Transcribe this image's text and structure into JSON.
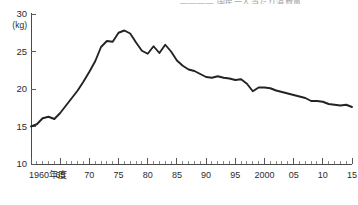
{
  "title_partial": "———— 国民一人当たり消費量",
  "chart_data": {
    "type": "line",
    "title": "",
    "xlabel": "",
    "ylabel": "",
    "unit_label": "(kg)",
    "ylim": [
      10,
      30
    ],
    "xlim": [
      1960,
      2015
    ],
    "grid": false,
    "legend": "none",
    "y_ticks": [
      "30",
      "25",
      "20",
      "15",
      "10"
    ],
    "y_tick_values": [
      30,
      25,
      20,
      15,
      10
    ],
    "x_ticks": [
      "1960年度",
      "65",
      "70",
      "75",
      "80",
      "85",
      "90",
      "95",
      "2000",
      "05",
      "10",
      "15"
    ],
    "x_tick_values": [
      1960,
      1965,
      1970,
      1975,
      1980,
      1985,
      1990,
      1995,
      2000,
      2005,
      2010,
      2015
    ],
    "series": [
      {
        "name": "一人当たり消費量",
        "color": "#232323",
        "x": [
          1960,
          1961,
          1962,
          1963,
          1964,
          1965,
          1966,
          1967,
          1968,
          1969,
          1970,
          1971,
          1972,
          1973,
          1974,
          1975,
          1976,
          1977,
          1978,
          1979,
          1980,
          1981,
          1982,
          1983,
          1984,
          1985,
          1986,
          1987,
          1988,
          1989,
          1990,
          1991,
          1992,
          1993,
          1994,
          1995,
          1996,
          1997,
          1998,
          1999,
          2000,
          2001,
          2002,
          2003,
          2004,
          2005,
          2006,
          2007,
          2008,
          2009,
          2010,
          2011,
          2012,
          2013,
          2014,
          2015
        ],
        "values": [
          15.0,
          15.3,
          16.1,
          16.3,
          16.0,
          16.8,
          17.8,
          18.8,
          19.8,
          21.0,
          22.3,
          23.7,
          25.6,
          26.4,
          26.3,
          27.5,
          27.8,
          27.4,
          26.2,
          25.1,
          24.7,
          25.7,
          24.8,
          25.9,
          25.0,
          23.8,
          23.1,
          22.6,
          22.4,
          22.0,
          21.6,
          21.5,
          21.7,
          21.5,
          21.4,
          21.2,
          21.3,
          20.7,
          19.7,
          20.2,
          20.2,
          20.1,
          19.8,
          19.6,
          19.4,
          19.2,
          19.0,
          18.8,
          18.4,
          18.4,
          18.3,
          18.0,
          17.9,
          17.8,
          17.9,
          17.6
        ]
      }
    ]
  }
}
